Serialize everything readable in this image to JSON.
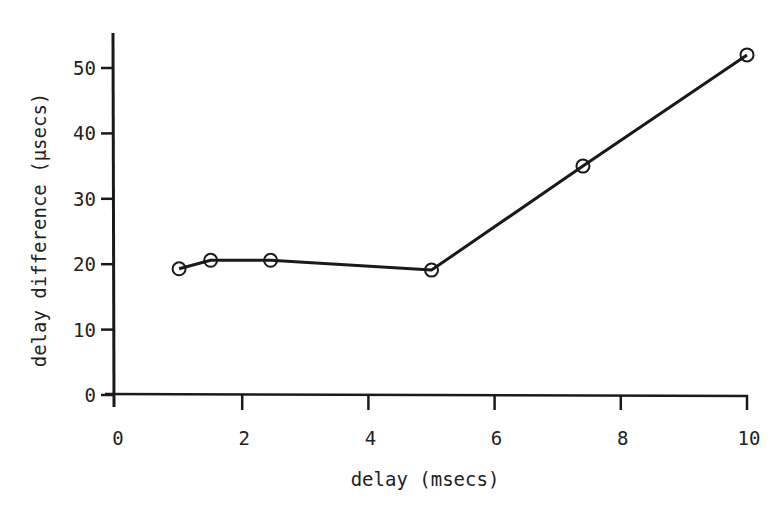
{
  "chart_data": {
    "type": "line",
    "title": "",
    "xlabel": "delay (msecs)",
    "ylabel": "delay difference (µsecs)",
    "xlim": [
      0,
      10
    ],
    "ylim": [
      0,
      55
    ],
    "x_ticks": [
      0,
      2,
      4,
      6,
      8,
      10
    ],
    "y_ticks": [
      0,
      10,
      20,
      30,
      40,
      50
    ],
    "grid": false,
    "legend": null,
    "marker": "open-circle",
    "series": [
      {
        "name": "delay difference",
        "x": [
          1.0,
          1.5,
          2.45,
          5.0,
          7.4,
          10.0
        ],
        "y": [
          19.3,
          20.6,
          20.6,
          19.1,
          35.0,
          52.0
        ]
      }
    ]
  },
  "axes": {
    "x_tick_labels": [
      "0",
      "2",
      "4",
      "6",
      "8",
      "10"
    ],
    "y_tick_labels": [
      "0",
      "10",
      "20",
      "30",
      "40",
      "50"
    ]
  },
  "colors": {
    "ink": "#1a1a1a",
    "background": "#ffffff"
  }
}
